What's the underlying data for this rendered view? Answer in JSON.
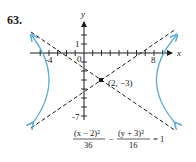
{
  "problem_number": "63.",
  "axes": {
    "x_label": "x",
    "y_label": "y",
    "x_tick_labels": [
      "-4",
      "0",
      "8"
    ],
    "y_tick_labels": [
      "1",
      "-7"
    ]
  },
  "center_label": "(2, −3)",
  "equation": {
    "term1_num": "(x − 2)²",
    "term1_den": "36",
    "minus": "−",
    "term2_num": "(y + 3)²",
    "term2_den": "16",
    "rhs": "= 1"
  },
  "colors": {
    "curve": "#5aaed6",
    "axes": "#1a1a1a",
    "asymptote": "#1a1a1a"
  }
}
